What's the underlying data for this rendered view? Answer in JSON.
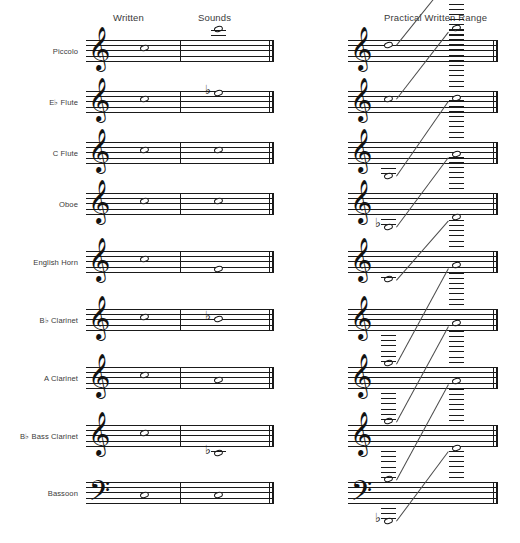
{
  "page": {
    "background": "#ffffff",
    "ink": "#1a1a1a"
  },
  "headers": {
    "written": "Written",
    "sounds": "Sounds",
    "practical_range": "Practical Written Range"
  },
  "glyphs": {
    "treble_clef": "𝄞",
    "bass_clef": "𝄢",
    "flat": "♭",
    "natural": "♮",
    "whole_note": "𝅝"
  },
  "rows": [
    {
      "label": "Piccolo",
      "label_prefix": "",
      "label_flat": false,
      "clef": "treble",
      "written_note": "C5",
      "sounds_note": "C6",
      "sounds_accidental": "",
      "transposition": "sounds one octave higher",
      "range_low": "D5",
      "range_high": "C8",
      "range_low_accidental": "",
      "range_high_ledgers": 3,
      "range_low_ledgers": 0
    },
    {
      "label": "E♭ Flute",
      "label_prefix": "E",
      "label_flat": true,
      "clef": "treble",
      "written_note": "C5",
      "sounds_note": "E♭5",
      "sounds_accidental": "♭",
      "transposition": "sounds a minor third higher",
      "range_low": "C5",
      "range_high": "C8",
      "range_low_accidental": "",
      "range_high_ledgers": 3,
      "range_low_ledgers": 0
    },
    {
      "label": "C Flute",
      "label_prefix": "C",
      "label_flat": false,
      "clef": "treble",
      "written_note": "C5",
      "sounds_note": "C5",
      "sounds_accidental": "",
      "transposition": "non-transposing",
      "range_low": "B3",
      "range_high": "C7",
      "range_low_accidental": "",
      "range_high_ledgers": 3,
      "range_low_ledgers": 1
    },
    {
      "label": "Oboe",
      "label_prefix": "",
      "label_flat": false,
      "clef": "treble",
      "written_note": "C5",
      "sounds_note": "C5",
      "sounds_accidental": "",
      "transposition": "non-transposing",
      "range_low": "B♭3",
      "range_high": "A6",
      "range_low_accidental": "♭",
      "range_high_ledgers": 3,
      "range_low_ledgers": 1
    },
    {
      "label": "English Horn",
      "label_prefix": "",
      "label_flat": false,
      "clef": "treble",
      "written_note": "C5",
      "sounds_note": "F4",
      "sounds_accidental": "",
      "transposition": "sounds a perfect fifth lower",
      "range_low": "B3",
      "range_high": "A6",
      "range_low_accidental": "",
      "range_high_ledgers": 2,
      "range_low_ledgers": 0
    },
    {
      "label": "B♭ Clarinet",
      "label_prefix": "B",
      "label_flat": true,
      "clef": "treble",
      "written_note": "C5",
      "sounds_note": "B♭4",
      "sounds_accidental": "♭",
      "transposition": "sounds a major second lower",
      "range_low": "E3",
      "range_high": "C7",
      "range_low_accidental": "",
      "range_high_ledgers": 3,
      "range_low_ledgers": 3
    },
    {
      "label": "A Clarinet",
      "label_prefix": "A",
      "label_flat": false,
      "clef": "treble",
      "written_note": "C5",
      "sounds_note": "A4",
      "sounds_accidental": "",
      "transposition": "sounds a minor third lower",
      "range_low": "E3",
      "range_high": "C7",
      "range_low_accidental": "",
      "range_high_ledgers": 3,
      "range_low_ledgers": 3
    },
    {
      "label": "B♭ Bass Clarinet",
      "label_prefix": "B",
      "label_flat": true,
      "clef": "treble",
      "written_note": "C5",
      "sounds_note": "B♭3",
      "sounds_accidental": "♭",
      "transposition": "sounds a major ninth lower",
      "range_low": "E3",
      "range_high": "C7",
      "range_low_accidental": "",
      "range_high_ledgers": 3,
      "range_low_ledgers": 3
    },
    {
      "label": "Bassoon",
      "label_prefix": "",
      "label_flat": false,
      "clef": "bass",
      "written_note": "C3",
      "sounds_note": "C3",
      "sounds_accidental": "",
      "transposition": "non-transposing",
      "range_low": "B♭1",
      "range_high": "E5",
      "range_low_accidental": "♭",
      "range_high_ledgers": 1,
      "range_low_ledgers": 1
    }
  ]
}
